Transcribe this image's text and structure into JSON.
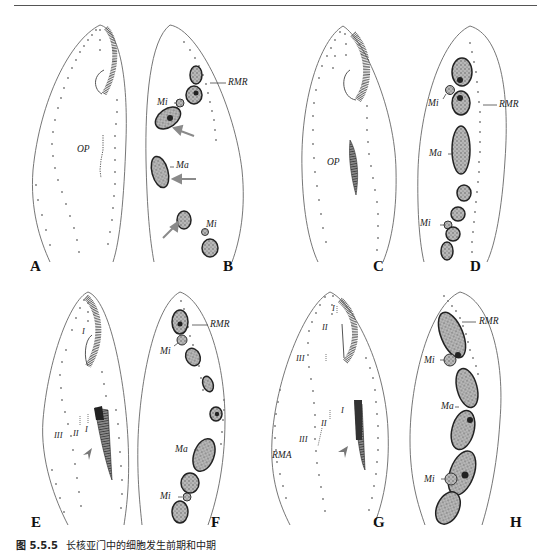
{
  "page": {
    "header_rule": true
  },
  "figure": {
    "caption_number": "图 5.5.5",
    "caption_text": "长核亚门中的细胞发生前期和中期",
    "colors": {
      "outline": "#555555",
      "dots": "#777777",
      "nucleus_fill": "#3a3a3a",
      "nucleus_stipple": "#9a9a9a",
      "arrow": "#8a8a8a",
      "text": "#222222"
    },
    "panels": [
      {
        "id": "A",
        "letter": "A",
        "labels": [
          "OP"
        ]
      },
      {
        "id": "B",
        "letter": "B",
        "labels": [
          "RMR",
          "Mi",
          "Ma",
          "Mi"
        ]
      },
      {
        "id": "C",
        "letter": "C",
        "labels": [
          "OP"
        ]
      },
      {
        "id": "D",
        "letter": "D",
        "labels": [
          "Mi",
          "RMR",
          "Ma",
          "Mi"
        ]
      },
      {
        "id": "E",
        "letter": "E",
        "labels": [
          "I",
          "III",
          "II",
          "I"
        ]
      },
      {
        "id": "F",
        "letter": "F",
        "labels": [
          "RMR",
          "Mi",
          "Ma",
          "Mi"
        ]
      },
      {
        "id": "G",
        "letter": "G",
        "labels": [
          "I",
          "II",
          "III",
          "I",
          "II",
          "III",
          "RMA"
        ]
      },
      {
        "id": "H",
        "letter": "H",
        "labels": [
          "RMR",
          "Mi",
          "Ma",
          "Mi"
        ]
      }
    ]
  },
  "labels": {
    "A": {
      "op": "OP"
    },
    "B": {
      "rmr": "RMR",
      "mi_top": "Mi",
      "ma": "Ma",
      "mi_bottom": "Mi"
    },
    "C": {
      "op": "OP"
    },
    "D": {
      "mi_top": "Mi",
      "rmr": "RMR",
      "ma": "Ma",
      "mi_bottom": "Mi"
    },
    "E": {
      "r1_top": "I",
      "r3": "III",
      "r2": "II",
      "r1": "I"
    },
    "F": {
      "rmr": "RMR",
      "mi_top": "Mi",
      "ma": "Ma",
      "mi_bottom": "Mi"
    },
    "G": {
      "r1_top": "I",
      "r2_top": "II",
      "r3_top": "III",
      "r1": "I",
      "r2": "II",
      "r3": "III",
      "rma": "RMA"
    },
    "H": {
      "rmr": "RMR",
      "mi_top": "Mi",
      "ma": "Ma",
      "mi_bottom": "Mi"
    }
  }
}
